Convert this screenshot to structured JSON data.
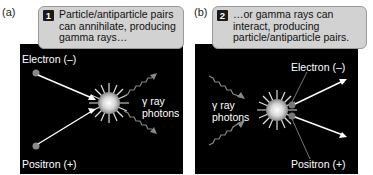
{
  "panel_a": {
    "label": "(a)",
    "step_number": "1",
    "callout_lines": [
      "Particle/antiparticle pairs",
      "can annihilate, producing",
      "gamma rays…"
    ],
    "electron_label": "Electron (–)",
    "positron_label": "Positron (+)",
    "photon_label_lines": [
      "γ ray",
      "photons"
    ]
  },
  "panel_b": {
    "label": "(b)",
    "step_number": "2",
    "callout_lines": [
      "…or gamma rays can",
      "interact, producing",
      "particle/antiparticle pairs."
    ],
    "electron_label": "Electron (–)",
    "positron_label": "Positron (+)",
    "photon_label_lines": [
      "γ ray",
      "photons"
    ]
  },
  "colors": {
    "panel_bg": "#000000",
    "callout_bg": "#d2d2d2",
    "particle": "#888888",
    "arrow": "#ffffff",
    "wave": "#888888"
  }
}
